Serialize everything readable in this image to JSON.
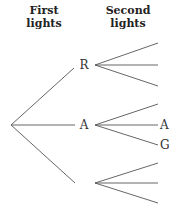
{
  "headers": {
    "first": [
      "First",
      "lights"
    ],
    "second": [
      "Second",
      "lights"
    ]
  },
  "tree": {
    "root": {
      "x": 11,
      "y": 125
    },
    "first_level": [
      {
        "label": "R",
        "label_pos": {
          "x": 84,
          "y": 69
        },
        "edge_end": {
          "x": 74,
          "y": 68
        },
        "node": {
          "x": 95,
          "y": 65
        },
        "children": [
          {
            "label": "",
            "end": {
              "x": 158,
              "y": 43
            }
          },
          {
            "label": "",
            "end": {
              "x": 158,
              "y": 65
            }
          },
          {
            "label": "",
            "end": {
              "x": 158,
              "y": 86
            }
          }
        ]
      },
      {
        "label": "A",
        "label_pos": {
          "x": 84,
          "y": 129
        },
        "edge_end": {
          "x": 75,
          "y": 125
        },
        "node": {
          "x": 95,
          "y": 125
        },
        "children": [
          {
            "label": "",
            "end": {
              "x": 158,
              "y": 104
            }
          },
          {
            "label": "A",
            "end": {
              "x": 158,
              "y": 125
            }
          },
          {
            "label": "G",
            "end": {
              "x": 158,
              "y": 145
            }
          }
        ]
      },
      {
        "label": "",
        "label_pos": {
          "x": 84,
          "y": 187
        },
        "edge_end": {
          "x": 75,
          "y": 183
        },
        "node": {
          "x": 95,
          "y": 183
        },
        "children": [
          {
            "label": "",
            "end": {
              "x": 158,
              "y": 163
            }
          },
          {
            "label": "",
            "end": {
              "x": 158,
              "y": 183
            }
          },
          {
            "label": "",
            "end": {
              "x": 158,
              "y": 203
            }
          }
        ]
      }
    ]
  }
}
